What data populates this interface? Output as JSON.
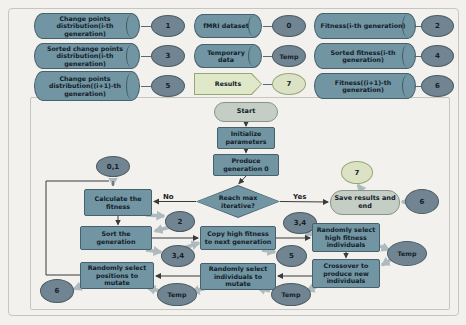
{
  "palette": {
    "store_fill": "#7195a2",
    "store_border": "#46606c",
    "ellipse_fill": "#708591",
    "light_fill": "#dbe3c4",
    "stadium_fill": "#c5cec5",
    "thick_arrow": "#afbabe",
    "thin_arrow": "#3a3a3a",
    "background": "#f2f1ed"
  },
  "legend": {
    "left": [
      {
        "label": "Change points distribution(i-th generation)",
        "tag": "1"
      },
      {
        "label": "Sorted change points distribution(i-th generation)",
        "tag": "3"
      },
      {
        "label": "Change points distribution((i+1)-th generation)",
        "tag": "5"
      }
    ],
    "middle": [
      {
        "label": "fMRI dataset",
        "tag": "0"
      },
      {
        "label": "Temporary data",
        "tag": "Temp"
      },
      {
        "label": "Results",
        "tag": "7"
      }
    ],
    "right": [
      {
        "label": "Fitness(i-th generation)",
        "tag": "2"
      },
      {
        "label": "Sorted fitness(i-th generation)",
        "tag": "4"
      },
      {
        "label": "Fitness((i+1)-th generation)",
        "tag": "6"
      }
    ]
  },
  "flow": {
    "start_label": "Start",
    "init_label": "Initialize parameters",
    "produce_label": "Produce generation 0",
    "decision_label": "Reach max iterative?",
    "yes_label": "Yes",
    "no_label": "No",
    "calc_label": "Calculate the fitness",
    "sort_label": "Sort the generation",
    "copy_label": "Copy high fitness to next generation",
    "select_high_label": "Randomly select high fitness individuals",
    "crossover_label": "Crossover to produce new individuals",
    "select_individuals_label": "Randomly select individuals to mutate",
    "select_positions_label": "Randomly select positions to mutate",
    "save_label": "Save results and end",
    "stores": {
      "s01": "0,1",
      "s2": "2",
      "s34_top": "3,4",
      "s34_left": "3,4",
      "s5": "5",
      "s6_left": "6",
      "s6_right": "6",
      "s7": "7",
      "temp_right": "Temp",
      "temp_mid": "Temp",
      "temp_left": "Temp"
    }
  }
}
